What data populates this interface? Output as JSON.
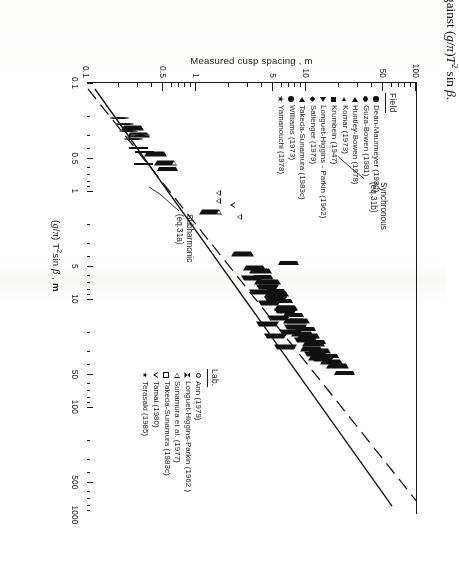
{
  "caption": {
    "label": "Figure 6.22:",
    "text": "Measured beach cusp spacing plotted against (g/π)T² sin β."
  },
  "chart_data": {
    "type": "scatter",
    "title": "",
    "xlabel": "(g/π) T² sin β , m",
    "ylabel": "Measured cusp spacing , m",
    "xscale": "log",
    "yscale": "log",
    "xlim": [
      0.1,
      1000
    ],
    "ylim": [
      0.1,
      100
    ],
    "grid": false,
    "xticks": [
      "0.1",
      "0.5",
      "1",
      "5",
      "10",
      "50",
      "100",
      "500",
      "1000"
    ],
    "yticks": [
      "0.1",
      "0.5",
      "1",
      "5",
      "10",
      "50",
      "100"
    ],
    "legend_position": "inside-lower-right",
    "annotations": [
      {
        "name": "synchronous",
        "line1": "Synchronous",
        "line2": "(eq.31b)"
      },
      {
        "name": "subharmonic",
        "line1": "Subharmonic",
        "line2": "(eq.31a)"
      }
    ],
    "fit_lines": [
      {
        "name": "subharmonic",
        "style": "solid",
        "equation_ref": "eq.31a",
        "p1": [
          0.1,
          0.105
        ],
        "p2": [
          1000,
          75
        ]
      },
      {
        "name": "synchronous",
        "style": "dashed",
        "equation_ref": "eq.31b",
        "p1": [
          0.1,
          0.052
        ],
        "p2": [
          1000,
          38
        ]
      }
    ],
    "series": [
      {
        "name": "Dean-Maurmeyer (1980)",
        "group": "Field",
        "marker": "filled-circle",
        "points": [
          [
            30,
            9.5
          ],
          [
            23,
            8.2
          ],
          [
            15,
            6.8
          ],
          [
            11,
            5.4
          ],
          [
            9,
            5.0
          ],
          [
            7.5,
            4.4
          ],
          [
            18,
            7.0
          ],
          [
            12,
            6.0
          ],
          [
            40,
            12
          ],
          [
            6,
            3.6
          ],
          [
            5,
            3.2
          ],
          [
            26,
            11
          ],
          [
            3.2,
            3.9
          ],
          [
            60,
            28
          ],
          [
            2.2,
            0.95
          ],
          [
            1.6,
            0.72
          ]
        ]
      },
      {
        "name": "Guza-Bowen (1981)",
        "group": "Field",
        "marker": "filled-hex",
        "points": [
          [
            45,
            20
          ],
          [
            33,
            14
          ],
          [
            28,
            13
          ],
          [
            20,
            9.5
          ],
          [
            17,
            8.6
          ],
          [
            13,
            7.5
          ],
          [
            10,
            6.2
          ],
          [
            8,
            5.0
          ],
          [
            6.5,
            4.6
          ],
          [
            52,
            25
          ],
          [
            24,
            10.5
          ],
          [
            9.5,
            4.2
          ]
        ]
      },
      {
        "name": "Huntley-Bowen (1978)",
        "group": "Field",
        "marker": "filled-tri-left",
        "points": [
          [
            38,
            17
          ],
          [
            30,
            13
          ],
          [
            22,
            10.5
          ],
          [
            16,
            8.4
          ],
          [
            12,
            6.6
          ],
          [
            9,
            5.4
          ],
          [
            7,
            4.6
          ],
          [
            5.5,
            3.8
          ],
          [
            42,
            19
          ],
          [
            26,
            11.5
          ]
        ]
      },
      {
        "name": "Komar (1973)",
        "group": "Field",
        "marker": "filled-tri-left-sm",
        "points": [
          [
            34,
            16
          ],
          [
            25,
            12
          ],
          [
            19,
            9.8
          ],
          [
            14,
            7.6
          ],
          [
            10.5,
            6.0
          ],
          [
            8.5,
            5.2
          ],
          [
            6.2,
            4.0
          ],
          [
            4.6,
            6.9
          ],
          [
            48,
            22
          ],
          [
            0.62,
            0.55
          ]
        ]
      },
      {
        "name": "Krumbein (1947)",
        "group": "Field",
        "marker": "filled-square",
        "points": [
          [
            180,
            62
          ],
          [
            150,
            55
          ],
          [
            120,
            48
          ],
          [
            95,
            42
          ],
          [
            78,
            38
          ],
          [
            64,
            33
          ],
          [
            110,
            52
          ],
          [
            88,
            30
          ],
          [
            200,
            70
          ],
          [
            56,
            27
          ]
        ]
      },
      {
        "name": "Longuet-Higgins - Parkin (1962)",
        "group": "Field",
        "marker": "filled-tri-right",
        "points": [
          [
            32,
            12
          ],
          [
            24,
            9.8
          ],
          [
            18,
            8.0
          ],
          [
            13,
            6.4
          ],
          [
            10,
            5.2
          ],
          [
            7.8,
            4.4
          ],
          [
            20,
            7.2
          ],
          [
            15,
            5.6
          ],
          [
            11,
            4.6
          ],
          [
            8.6,
            3.8
          ],
          [
            6.4,
            3.2
          ],
          [
            36,
            14
          ],
          [
            28,
            6.4
          ],
          [
            22,
            5.2
          ],
          [
            17,
            4.4
          ]
        ]
      },
      {
        "name": "Sallenger (1979)",
        "group": "Field",
        "marker": "filled-diamond",
        "points": [
          [
            31,
            13
          ],
          [
            23,
            11
          ],
          [
            17,
            8.8
          ],
          [
            13,
            7.2
          ],
          [
            9.8,
            5.8
          ],
          [
            7.4,
            4.8
          ],
          [
            5.6,
            3.6
          ],
          [
            40,
            16
          ],
          [
            27,
            12
          ],
          [
            0.85,
            0.8
          ]
        ]
      },
      {
        "name": "Takeda-Sunamura (1983c)",
        "group": "Field",
        "marker": "filled-tri-left2",
        "points": [
          [
            29,
            11
          ],
          [
            21,
            9.2
          ],
          [
            16,
            7.8
          ],
          [
            12,
            6.4
          ],
          [
            9.2,
            5.2
          ],
          [
            7.0,
            4.2
          ],
          [
            5.2,
            3.4
          ],
          [
            35,
            13
          ],
          [
            3.8,
            2.6
          ],
          [
            0.45,
            0.42
          ],
          [
            0.3,
            0.3
          ],
          [
            0.26,
            0.26
          ]
        ]
      },
      {
        "name": "Williams (1973)",
        "group": "Field",
        "marker": "filled-circle-lg",
        "points": [
          [
            27,
            12
          ],
          [
            20,
            9.6
          ],
          [
            15,
            7.8
          ],
          [
            11.5,
            6.4
          ],
          [
            8.8,
            5.2
          ],
          [
            6.8,
            4.4
          ],
          [
            5.0,
            3.4
          ],
          [
            33,
            14
          ],
          [
            4.0,
            2.8
          ]
        ]
      },
      {
        "name": "Yamanouchi (1978)",
        "group": "Field",
        "marker": "filled-star",
        "points": [
          [
            26,
            10.5
          ],
          [
            19,
            8.8
          ],
          [
            14.5,
            7.4
          ],
          [
            11,
            6.0
          ],
          [
            8.4,
            5.0
          ],
          [
            6.4,
            4.0
          ],
          [
            4.8,
            3.2
          ],
          [
            30,
            12
          ]
        ]
      },
      {
        "name": "Ann (1979)",
        "group": "Lab",
        "marker": "open-circle",
        "points": [
          [
            0.4,
            0.3
          ],
          [
            0.33,
            0.27
          ],
          [
            0.28,
            0.24
          ],
          [
            0.24,
            0.22
          ],
          [
            0.3,
            0.31
          ],
          [
            0.21,
            0.2
          ]
        ]
      },
      {
        "name": "Longuet-Higgins - Parkin (1962)",
        "group": "Lab",
        "marker": "open-bowtie",
        "points": [
          [
            0.62,
            0.52
          ],
          [
            0.7,
            0.52
          ],
          [
            0.78,
            0.52
          ],
          [
            0.86,
            0.52
          ],
          [
            0.95,
            0.52
          ],
          [
            1.9,
            1.35
          ],
          [
            2.3,
            1.35
          ],
          [
            2.8,
            1.35
          ],
          [
            0.12,
            0.105
          ],
          [
            0.135,
            0.105
          ],
          [
            0.15,
            0.105
          ],
          [
            0.17,
            0.105
          ],
          [
            0.19,
            0.105
          ],
          [
            1.5,
            1.35
          ]
        ]
      },
      {
        "name": "Sunamura et al. (1977)",
        "group": "Lab",
        "marker": "open-tri-left",
        "points": [
          [
            0.55,
            0.52
          ],
          [
            1.55,
            1.35
          ]
        ]
      },
      {
        "name": "Takeda-Sunamura (1983c)",
        "group": "Lab",
        "marker": "open-square",
        "points": [
          [
            0.44,
            0.34
          ],
          [
            0.56,
            0.33
          ],
          [
            0.4,
            0.3
          ]
        ]
      },
      {
        "name": "Tamai (1980)",
        "group": "Lab",
        "marker": "open-tri-down",
        "points": [
          [
            1.35,
            1.7
          ],
          [
            1.75,
            1.95
          ],
          [
            1.05,
            1.25
          ],
          [
            1.25,
            1.25
          ]
        ]
      },
      {
        "name": "Terasaki (1985)",
        "group": "Lab",
        "marker": "open-star",
        "points": [
          [
            0.125,
            0.105
          ],
          [
            0.145,
            0.105
          ]
        ]
      }
    ]
  },
  "legends": [
    {
      "title": "Field",
      "entries": [
        {
          "symbol": "filled-circle",
          "label": "Dean-Maurmeyer (1980)"
        },
        {
          "symbol": "filled-hex",
          "label": "Guza-Bowen (1981)"
        },
        {
          "symbol": "filled-tri-left",
          "label": "Huntley-Bowen (1978)"
        },
        {
          "symbol": "filled-tri-left-sm",
          "label": "Komar (1973)"
        },
        {
          "symbol": "filled-square",
          "label": "Krumbein (1947)"
        },
        {
          "symbol": "filled-tri-right",
          "label": "Longuet-Higgins - Parkin (1962)"
        },
        {
          "symbol": "filled-diamond",
          "label": "Sallenger (1979)"
        },
        {
          "symbol": "filled-tri-left2",
          "label": "Takeda-Sunamura (1983c)"
        },
        {
          "symbol": "filled-circle-lg",
          "label": "Williams (1973)"
        },
        {
          "symbol": "filled-star",
          "label": "Yamanouchi (1978)"
        }
      ]
    },
    {
      "title": "Lab.",
      "entries": [
        {
          "symbol": "open-circle",
          "label": "Ann (1979)"
        },
        {
          "symbol": "open-bowtie",
          "label": "Longuet-Higgins-Parkin (1962 )"
        },
        {
          "symbol": "open-tri-left",
          "label": "Sunamura et al. (1977)"
        },
        {
          "symbol": "open-square",
          "label": "Takeda-Sunamura (1983c)"
        },
        {
          "symbol": "open-tri-down",
          "label": "Tamai (1980)"
        },
        {
          "symbol": "open-star",
          "label": "Terasaki (1985)"
        }
      ]
    }
  ]
}
